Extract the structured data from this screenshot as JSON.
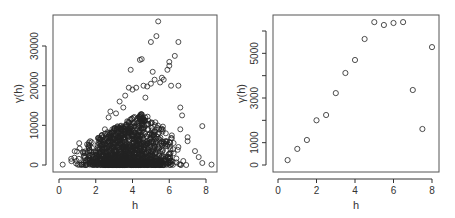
{
  "chart_data": [
    {
      "type": "scatter",
      "title": "",
      "xlabel": "h",
      "ylabel": "γ(h)",
      "xlim": [
        0,
        8.4
      ],
      "ylim": [
        -1200,
        37000
      ],
      "xticks": [
        0,
        2,
        4,
        6,
        8
      ],
      "yticks": [
        0,
        10000,
        20000,
        30000
      ],
      "ytick_labels": [
        "0",
        "10000",
        "20000",
        "30000"
      ],
      "grid": false,
      "legend": null,
      "description": "Variogram cloud: dense mass of points near zero for h in 0.2–8.3, spread increasing with h up to ~6, outliers reaching ~36000",
      "points": [
        [
          0.2,
          100
        ],
        [
          1.1,
          5500
        ],
        [
          1.7,
          6000
        ],
        [
          2.2,
          6500
        ],
        [
          2.5,
          9000
        ],
        [
          2.7,
          12000
        ],
        [
          2.8,
          13500
        ],
        [
          3.1,
          13000
        ],
        [
          3.3,
          16000
        ],
        [
          3.5,
          14500
        ],
        [
          3.6,
          17500
        ],
        [
          3.8,
          19500
        ],
        [
          3.9,
          24000
        ],
        [
          4.0,
          19000
        ],
        [
          4.2,
          19500
        ],
        [
          4.4,
          26500
        ],
        [
          4.5,
          26700
        ],
        [
          4.6,
          20000
        ],
        [
          4.7,
          17000
        ],
        [
          4.8,
          19800
        ],
        [
          5.0,
          31000
        ],
        [
          5.0,
          20500
        ],
        [
          5.1,
          23500
        ],
        [
          5.2,
          21500
        ],
        [
          5.3,
          32500
        ],
        [
          5.4,
          36200
        ],
        [
          5.5,
          20800
        ],
        [
          5.6,
          22000
        ],
        [
          5.7,
          21500
        ],
        [
          5.9,
          24000
        ],
        [
          6.0,
          26000
        ],
        [
          6.0,
          25000
        ],
        [
          6.1,
          20000
        ],
        [
          6.3,
          27500
        ],
        [
          6.5,
          31000
        ],
        [
          6.5,
          20000
        ],
        [
          6.6,
          14500
        ],
        [
          6.7,
          12500
        ],
        [
          6.6,
          9000
        ],
        [
          7.0,
          7000
        ],
        [
          7.0,
          6000
        ],
        [
          7.4,
          3500
        ],
        [
          7.6,
          2000
        ],
        [
          7.8,
          9800
        ],
        [
          7.8,
          500
        ],
        [
          8.3,
          100
        ]
      ],
      "cloud": {
        "count": 1400,
        "h_range": [
          0.3,
          7.2
        ],
        "peak_h": 4.5
      }
    },
    {
      "type": "scatter",
      "title": "",
      "xlabel": "h",
      "ylabel": "γ(h)",
      "xlim": [
        -0.1,
        8.2
      ],
      "ylim": [
        -250,
        6500
      ],
      "xticks": [
        0,
        2,
        4,
        6,
        8
      ],
      "yticks": [
        0,
        1000,
        2000,
        3000,
        4000,
        5000,
        6000
      ],
      "ytick_labels": [
        "0",
        "1000",
        "",
        "3000",
        "",
        "5000",
        ""
      ],
      "grid": false,
      "legend": null,
      "x": [
        0.5,
        1.0,
        1.5,
        2.0,
        2.5,
        3.0,
        3.5,
        4.0,
        4.5,
        5.0,
        5.5,
        6.0,
        6.5,
        7.0,
        7.5,
        8.0
      ],
      "y": [
        220,
        720,
        1120,
        2000,
        2240,
        3220,
        4120,
        4700,
        5640,
        6400,
        6270,
        6360,
        6400,
        3360,
        1610,
        5280
      ]
    }
  ]
}
